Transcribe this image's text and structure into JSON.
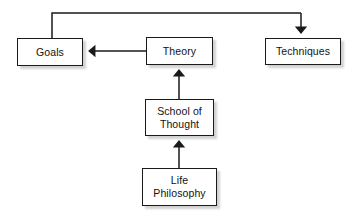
{
  "diagram": {
    "type": "flowchart",
    "title": "",
    "background_color": "#ffffff",
    "line_color": "#1a1a1a",
    "box_fill_color": "#ffffff",
    "text_color": "#121212",
    "nodes": [
      {
        "id": "goals",
        "label": "Goals"
      },
      {
        "id": "theory",
        "label": "Theory"
      },
      {
        "id": "techniques",
        "label": "Techniques"
      },
      {
        "id": "school",
        "label": "School of\nThought"
      },
      {
        "id": "life",
        "label": "Life\nPhilosophy"
      }
    ],
    "edges": [
      {
        "from": "theory",
        "to": "goals",
        "style": "elbow-top",
        "arrow": "none"
      },
      {
        "from": "theory",
        "to": "techniques",
        "style": "elbow-top",
        "arrow": "end"
      },
      {
        "from": "theory",
        "to": "goals",
        "style": "horizontal",
        "arrow": "end"
      },
      {
        "from": "school",
        "to": "theory",
        "style": "vertical-up",
        "arrow": "end"
      },
      {
        "from": "life",
        "to": "school",
        "style": "vertical-up",
        "arrow": "end"
      }
    ]
  }
}
